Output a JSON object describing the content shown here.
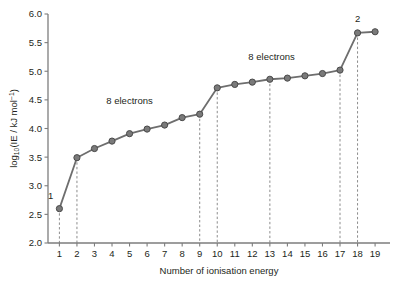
{
  "chart_data": {
    "type": "line",
    "title": "",
    "xlabel": "Number of ionisation energy",
    "ylabel": "log10(IE / kJ mol-1)",
    "ylabel_parts": {
      "lead": "log",
      "sub": "10",
      "mid": "(IE / kJ mol",
      "sup": "−1",
      "tail": ")"
    },
    "x": [
      1,
      2,
      3,
      4,
      5,
      6,
      7,
      8,
      9,
      10,
      11,
      12,
      13,
      14,
      15,
      16,
      17,
      18,
      19
    ],
    "values": [
      2.6,
      3.49,
      3.65,
      3.78,
      3.91,
      3.99,
      4.06,
      4.19,
      4.25,
      4.71,
      4.77,
      4.81,
      4.86,
      4.88,
      4.92,
      4.96,
      5.02,
      5.67,
      5.69
    ],
    "xlim": [
      0.35,
      19.85
    ],
    "ylim": [
      2.0,
      6.0
    ],
    "xticks": [
      1,
      2,
      3,
      4,
      5,
      6,
      7,
      8,
      9,
      10,
      11,
      12,
      13,
      14,
      15,
      16,
      17,
      18,
      19
    ],
    "xtick_labels": [
      "1",
      "2",
      "3",
      "4",
      "5",
      "6",
      "7",
      "8",
      "9",
      "10",
      "11",
      "12",
      "13",
      "14",
      "15",
      "16",
      "17",
      "18",
      "19"
    ],
    "yticks": [
      2.0,
      2.5,
      3.0,
      3.5,
      4.0,
      4.5,
      5.0,
      5.5,
      6.0
    ],
    "ytick_labels": [
      "2.0",
      "2.5",
      "3.0",
      "3.5",
      "4.0",
      "4.5",
      "5.0",
      "5.5",
      "6.0"
    ],
    "grid": false,
    "legend": "none",
    "dashed_guides": [
      1,
      2,
      9,
      10,
      13,
      17,
      18
    ],
    "annotations": [
      {
        "name": "shell-count-1",
        "text": "1",
        "x": 1.0,
        "y": 2.76,
        "anchor": "end"
      },
      {
        "name": "shell-count-8-inner",
        "text": "8 electrons",
        "x": 5.0,
        "y": 4.43,
        "anchor": "middle"
      },
      {
        "name": "shell-count-8-outer",
        "text": "8 electrons",
        "x": 13.1,
        "y": 5.2,
        "anchor": "middle"
      },
      {
        "name": "shell-count-2",
        "text": "2",
        "x": 18.0,
        "y": 5.86,
        "anchor": "middle"
      }
    ],
    "colors": {
      "line": "#6e6e6e",
      "marker_fill": "#7a7a7a",
      "marker_edge": "#4a4a4a",
      "axis": "#7d7d7d",
      "guide": "#8c8c8c",
      "text": "#231f20",
      "background": "#ffffff"
    }
  }
}
